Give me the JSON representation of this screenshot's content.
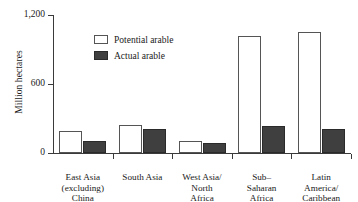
{
  "chart_data": {
    "type": "bar",
    "title": "",
    "xlabel": "",
    "ylabel": "Million hectares",
    "ylim": [
      0,
      1200
    ],
    "yticks": [
      0,
      600,
      1200
    ],
    "ytick_labels": [
      "0",
      "600",
      "1,200"
    ],
    "grid": false,
    "legend_position": "upper-left-inside",
    "categories": [
      "East Asia\n(excluding)\nChina",
      "South Asia",
      "West Asia/\nNorth\nAfrica",
      "Sub–\nSaharan\nAfrica",
      "Latin\nAmerica/\nCaribbean"
    ],
    "series": [
      {
        "name": "Potential arable",
        "color": "#ffffff",
        "values": [
          190,
          245,
          105,
          1020,
          1055
        ]
      },
      {
        "name": "Actual arable",
        "color": "#3f3f3f",
        "values": [
          105,
          210,
          90,
          235,
          210
        ]
      }
    ]
  },
  "legend": {
    "items": [
      {
        "label": "Potential arable"
      },
      {
        "label": "Actual arable"
      }
    ]
  }
}
